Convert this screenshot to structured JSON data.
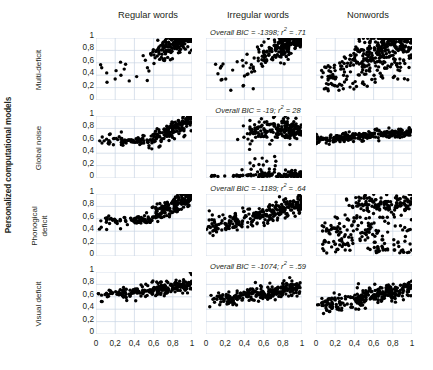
{
  "figure": {
    "group_label": "Personalized computational models",
    "column_headers": [
      "Regular words",
      "Irregular words",
      "Nonwords"
    ],
    "row_labels": [
      {
        "lines": [
          "Multi-deficit"
        ]
      },
      {
        "lines": [
          "Global noise"
        ]
      },
      {
        "lines": [
          "Phonogical",
          "deficit"
        ]
      },
      {
        "lines": [
          "Visual deficit"
        ]
      }
    ],
    "annotations": [
      {
        "text": "Overall BIC = -1398; r",
        "sup": "2",
        "tail": " = .71"
      },
      {
        "text": "Overall BIC = -19; r",
        "sup": "2",
        "tail": " =  28"
      },
      {
        "text": "Overall BIC = -1189; r",
        "sup": "2",
        "tail": " =  .64"
      },
      {
        "text": "Overall BIC = -1074; r",
        "sup": "2",
        "tail": " = .59"
      }
    ]
  },
  "chart_data": {
    "type": "scatter",
    "title": "",
    "xlabel": "",
    "ylabel": "",
    "xlim": [
      0,
      1
    ],
    "ylim": [
      0,
      1
    ],
    "grid": true,
    "legend_position": "none",
    "xticks": [
      "0",
      "0,2",
      "0,4",
      "0,6",
      "0,8",
      "1"
    ],
    "xtick_values": [
      0,
      0.2,
      0.4,
      0.6,
      0.8,
      1
    ],
    "yticks": [
      "1",
      "0,8",
      "0,6",
      "0,4",
      "0,2",
      "0"
    ],
    "ytick_values": [
      1,
      0.8,
      0.6,
      0.4,
      0.2,
      0
    ],
    "marker": {
      "shape": "circle",
      "color": "#000000",
      "size_px": 3.4
    },
    "row_names": [
      "Multi-deficit",
      "Global noise",
      "Phonogical deficit",
      "Visual deficit"
    ],
    "column_names": [
      "Regular words",
      "Irregular words",
      "Nonwords"
    ],
    "overall_bic": [
      -1398,
      -19,
      -1189,
      -1074
    ],
    "r_squared": [
      0.71,
      0.28,
      0.64,
      0.59
    ],
    "panels": [
      {
        "row": "Multi-deficit",
        "col": "Regular words",
        "n_points": 230,
        "cluster": {
          "kind": "diagonal-band",
          "x_range": [
            0.03,
            1.0
          ],
          "y_range": [
            0.18,
            1.0
          ],
          "dense_from": [
            0.55,
            0.7
          ],
          "outliers": 14,
          "slope": 0.85
        }
      },
      {
        "row": "Multi-deficit",
        "col": "Irregular words",
        "n_points": 240,
        "cluster": {
          "kind": "diagonal-band",
          "x_range": [
            0.02,
            1.0
          ],
          "y_range": [
            0.14,
            1.0
          ],
          "dense_from": [
            0.45,
            0.6
          ],
          "outliers": 16,
          "slope": 0.8
        }
      },
      {
        "row": "Multi-deficit",
        "col": "Nonwords",
        "n_points": 300,
        "cluster": {
          "kind": "broad-diagonal",
          "x_range": [
            0.0,
            1.0
          ],
          "y_range": [
            0.1,
            1.0
          ],
          "dense_from": [
            0.35,
            0.6
          ],
          "outliers": 10,
          "slope": 0.75
        }
      },
      {
        "row": "Global noise",
        "col": "Regular words",
        "n_points": 230,
        "cluster": {
          "kind": "flat-band-then-rise",
          "band_y": 0.6,
          "rise_from_x": 0.55,
          "x_range": [
            0.03,
            1.0
          ],
          "y_range": [
            0.55,
            1.0
          ],
          "outliers": 8
        }
      },
      {
        "row": "Global noise",
        "col": "Irregular words",
        "n_points": 290,
        "cluster": {
          "kind": "two-bands",
          "upper_band_y": 0.78,
          "lower_band_y": 0.02,
          "x_range": [
            0.02,
            1.0
          ],
          "outliers": 6
        }
      },
      {
        "row": "Global noise",
        "col": "Nonwords",
        "n_points": 250,
        "cluster": {
          "kind": "flat-band",
          "band_y": 0.62,
          "band_thickness": 0.09,
          "x_range": [
            0.0,
            1.0
          ],
          "slope": 0.12
        }
      },
      {
        "row": "Phonogical deficit",
        "col": "Regular words",
        "n_points": 235,
        "cluster": {
          "kind": "flat-band-then-rise",
          "band_y": 0.58,
          "rise_from_x": 0.5,
          "x_range": [
            0.03,
            1.0
          ],
          "y_range": [
            0.42,
            1.0
          ],
          "outliers": 10
        }
      },
      {
        "row": "Phonogical deficit",
        "col": "Irregular words",
        "n_points": 260,
        "cluster": {
          "kind": "rising-band",
          "x_range": [
            0.02,
            1.0
          ],
          "y_range": [
            0.4,
            1.0
          ],
          "band_y": 0.62,
          "slope": 0.4,
          "outliers": 6
        }
      },
      {
        "row": "Phonogical deficit",
        "col": "Nonwords",
        "n_points": 290,
        "cluster": {
          "kind": "wide-scatter-plus-top-band",
          "top_band_y": 0.85,
          "x_range": [
            0.0,
            1.0
          ],
          "y_range": [
            0.02,
            1.0
          ],
          "outliers": 12
        }
      },
      {
        "row": "Visual deficit",
        "col": "Regular words",
        "n_points": 225,
        "cluster": {
          "kind": "flat-band-slight-rise",
          "band_y": 0.7,
          "x_range": [
            0.03,
            1.0
          ],
          "y_range": [
            0.6,
            0.95
          ],
          "slope": 0.2,
          "outliers": 8
        }
      },
      {
        "row": "Visual deficit",
        "col": "Irregular words",
        "n_points": 250,
        "cluster": {
          "kind": "flat-band-slight-rise",
          "band_y": 0.64,
          "x_range": [
            0.02,
            1.0
          ],
          "y_range": [
            0.42,
            0.92
          ],
          "slope": 0.25,
          "outliers": 8
        }
      },
      {
        "row": "Visual deficit",
        "col": "Nonwords",
        "n_points": 255,
        "cluster": {
          "kind": "rising-band",
          "band_y": 0.58,
          "x_range": [
            0.0,
            1.0
          ],
          "y_range": [
            0.4,
            0.9
          ],
          "slope": 0.3,
          "outliers": 6
        }
      }
    ]
  }
}
